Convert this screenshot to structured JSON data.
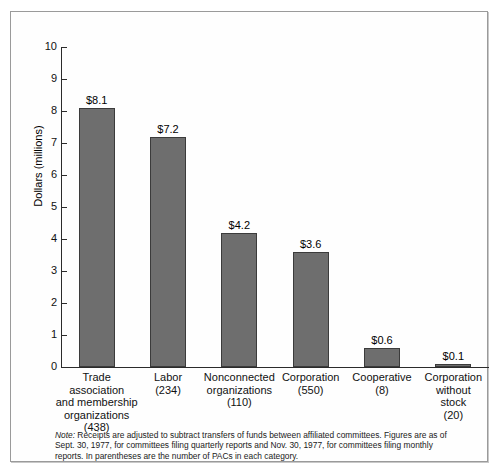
{
  "chart_data": {
    "type": "bar",
    "title": "",
    "xlabel": "",
    "ylabel": "Dollars (millions)",
    "ylim": [
      0,
      10
    ],
    "yticks": [
      0,
      1,
      2,
      3,
      4,
      5,
      6,
      7,
      8,
      9,
      10
    ],
    "ytick_labels": [
      "0",
      "1",
      "2",
      "3",
      "4",
      "5",
      "6",
      "7",
      "8",
      "9",
      "10"
    ],
    "grid": false,
    "legend": "none",
    "categories": [
      "Trade association and membership organizations (438)",
      "Labor (234)",
      "Nonconnected organizations (110)",
      "Corporation (550)",
      "Cooperative (8)",
      "Corporation without stock (20)"
    ],
    "values": [
      8.1,
      7.2,
      4.2,
      3.6,
      0.6,
      0.1
    ],
    "data_labels": [
      "$8.1",
      "$7.2",
      "$4.2",
      "$3.6",
      "$0.6",
      "$0.1"
    ],
    "bar_color": "#6e6e6e",
    "bar_edge_color": "#3b3b3b",
    "axis_color": "#2b2b2b",
    "pac_counts": [
      438,
      234,
      110,
      550,
      8,
      20
    ],
    "bars": [
      {
        "value": 8.1,
        "label": "$8.1",
        "name_lines": [
          "Trade",
          "association",
          "and membership",
          "organizations",
          "(438)"
        ]
      },
      {
        "value": 7.2,
        "label": "$7.2",
        "name_lines": [
          "Labor",
          "(234)"
        ]
      },
      {
        "value": 4.2,
        "label": "$4.2",
        "name_lines": [
          "Nonconnected",
          "organizations",
          "(110)"
        ]
      },
      {
        "value": 3.6,
        "label": "$3.6",
        "name_lines": [
          "Corporation",
          "(550)"
        ]
      },
      {
        "value": 0.6,
        "label": "$0.6",
        "name_lines": [
          "Cooperative",
          "(8)"
        ]
      },
      {
        "value": 0.1,
        "label": "$0.1",
        "name_lines": [
          "Corporation",
          "without",
          "stock",
          "(20)"
        ]
      }
    ]
  },
  "note": {
    "lead": "Note:",
    "body": " Receipts are adjusted to subtract transfers of funds between affiliated committees. Figures are as of Sept. 30, 1977, for committees filing quarterly reports and Nov. 30, 1977, for committees filing monthly reports. In parentheses are the number of PACs in each category."
  }
}
